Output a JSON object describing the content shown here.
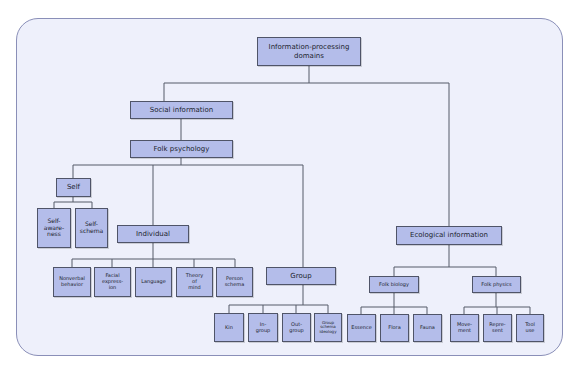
{
  "diagram": {
    "root": "Information-processing domains",
    "social": "Social information",
    "folk_psychology": "Folk psychology",
    "self": "Self",
    "self_children": [
      "Self-awareness",
      "Self-schema"
    ],
    "individual": "Individual",
    "individual_children": [
      "Nonverbal behavior",
      "Facial expression",
      "Language",
      "Theory of mind",
      "Person schema"
    ],
    "group": "Group",
    "group_children": [
      "Kin",
      "In-group",
      "Out-group",
      "Group schema ideology"
    ],
    "ecological": "Ecological information",
    "folk_biology": "Folk biology",
    "biology_children": [
      "Essence",
      "Flora",
      "Fauna"
    ],
    "folk_physics": "Folk physics",
    "physics_children": [
      "Movement",
      "Represent",
      "Tool use"
    ]
  },
  "labels": {
    "root": "Information-processing\ndomains",
    "self_awareness": "Self-\naware-\nness",
    "self_schema": "Self-\nschema",
    "nonverbal": "Nonverbal\nbehavior",
    "facial": "Facial\nexpress-\nion",
    "language": "Language",
    "theory": "Theory\nof\nmind",
    "person": "Person\nschema",
    "kin": "Kin",
    "in_group": "In-\ngroup",
    "out_group": "Out-\ngroup",
    "group_schema": "Group\nschema\nideology",
    "essence": "Essence",
    "flora": "Flora",
    "fauna": "Fauna",
    "movement": "Move-\nment",
    "represent": "Repre-\nsent",
    "tool_use": "Tool\nuse"
  },
  "colors": {
    "background": "#eef0fb",
    "frame_border": "#8a8fb8",
    "node_fill": "#b4bdea",
    "node_border": "#4f5468",
    "line": "#555a68"
  }
}
